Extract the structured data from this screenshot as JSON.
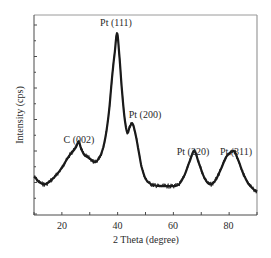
{
  "chart_data": {
    "type": "line",
    "title": "",
    "xlabel": "2 Theta (degree)",
    "ylabel": "Intensity (cps)",
    "xlim": [
      10,
      90
    ],
    "ylim": [
      0,
      100
    ],
    "xticks": [
      20,
      40,
      60,
      80
    ],
    "xminor_ticks": [
      10,
      30,
      50,
      70,
      90
    ],
    "yticks_labeled": false,
    "grid": false,
    "legend": null,
    "line_color": "#1a1a1a",
    "series": [
      {
        "name": "XRD pattern",
        "x": [
          10,
          12,
          14,
          16,
          18,
          20,
          22,
          24,
          25,
          26,
          27,
          28,
          30,
          32,
          34,
          35,
          36,
          37,
          38,
          39,
          39.8,
          40.5,
          41.5,
          42.5,
          43.5,
          44.3,
          45.3,
          46.3,
          47.3,
          48.5,
          50,
          52,
          55,
          58,
          60,
          62,
          64,
          66,
          67.5,
          69,
          71,
          73,
          75,
          77,
          79,
          81.7,
          83,
          85,
          87,
          90
        ],
        "y": [
          18,
          15,
          14,
          16,
          19,
          23,
          28,
          32,
          34,
          37,
          33,
          30,
          28,
          26,
          30,
          35,
          43,
          55,
          72,
          86,
          96,
          86,
          66,
          50,
          42,
          45,
          47,
          42,
          34,
          24,
          17,
          14,
          13,
          13,
          13,
          14,
          19,
          27,
          32,
          26,
          18,
          14,
          16,
          22,
          29,
          32,
          28,
          20,
          14,
          10
        ]
      }
    ],
    "annotations": [
      {
        "text": "C (002)",
        "x": 26,
        "y": 37
      },
      {
        "text": "Pt (111)",
        "x": 39.8,
        "y": 96
      },
      {
        "text": "Pt (200)",
        "x": 45.3,
        "y": 47
      },
      {
        "text": "Pt (220)",
        "x": 67.5,
        "y": 32
      },
      {
        "text": "Pt (311)",
        "x": 81.7,
        "y": 32
      }
    ]
  },
  "labels": {
    "xlabel": "2 Theta (degree)",
    "ylabel": "Intensity (cps)",
    "x20": "20",
    "x40": "40",
    "x60": "60",
    "x80": "80",
    "ann_c002": "C (002)",
    "ann_pt111": "Pt (111)",
    "ann_pt200": "Pt (200)",
    "ann_pt220": "Pt (220)",
    "ann_pt311": "Pt (311)"
  }
}
